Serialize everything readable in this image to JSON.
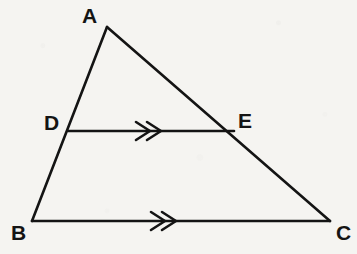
{
  "figure": {
    "background_color": "#f5f4f1",
    "stroke_color": "#141414",
    "stroke_width": 2.6,
    "width": 357,
    "height": 254,
    "points": {
      "A": {
        "label": "A",
        "x": 107,
        "y": 27,
        "label_x": 82,
        "label_y": 5
      },
      "B": {
        "label": "B",
        "x": 32,
        "y": 221,
        "label_x": 11,
        "label_y": 222
      },
      "C": {
        "label": "C",
        "x": 330,
        "y": 221,
        "label_x": 336,
        "label_y": 222
      },
      "D": {
        "label": "D",
        "x": 68,
        "y": 131,
        "label_x": 44,
        "label_y": 112
      },
      "E": {
        "label": "E",
        "x": 234,
        "y": 132,
        "label_x": 238,
        "label_y": 110
      }
    },
    "segments": [
      {
        "name": "AB",
        "from": "A",
        "to": "B",
        "marks": 0
      },
      {
        "name": "AC",
        "from": "A",
        "to": "C",
        "marks": 0
      },
      {
        "name": "BC",
        "from": "B",
        "to": "C",
        "marks": 2
      },
      {
        "name": "DE",
        "from": "D",
        "to": "E",
        "marks": 2
      }
    ],
    "parallel_marks": [
      {
        "name": "de-parallel-marks",
        "segment": "DE",
        "center_x": 148,
        "center_y": 130,
        "count": 2,
        "direction": "right"
      },
      {
        "name": "bc-parallel-marks",
        "segment": "BC",
        "center_x": 163,
        "center_y": 221,
        "count": 2,
        "direction": "right"
      }
    ]
  }
}
